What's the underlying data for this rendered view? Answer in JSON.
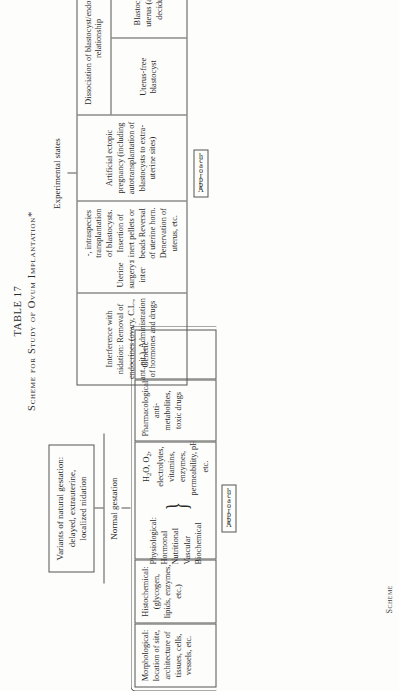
{
  "title": {
    "line1": "TABLE 17",
    "line2": "Scheme for Study of Ovum Implantation*"
  },
  "footer": {
    "scheme_label": "Scheme"
  },
  "normal_gestation": {
    "variants_box": "Variants of natural gestation: delayed, extrauterine, localized nidation",
    "branch_label": "Normal gestation",
    "approach_label_letters": [
      "A",
      "p",
      "p",
      "r",
      "o",
      "a",
      "c",
      "h"
    ],
    "approach_label": "Approach",
    "cells": [
      {
        "name": "morphological",
        "text": "Morphological: location of site, architecture of tissues, cells, vessels, etc."
      },
      {
        "name": "histochemical",
        "text": "Histochemical: (glycogen, lipids, enzymes, etc.)"
      },
      {
        "name": "physiological",
        "heading": "Physiological:",
        "items": [
          "Hormonal",
          "Nutritional",
          "Vascular",
          "Biochemical"
        ],
        "detail": "H2O, O2, electrolytes, vitamins, enzymes, permeability, pH, etc."
      },
      {
        "name": "pharmacological",
        "text": "Pharmacological: anti-metabolites, toxic drugs"
      },
      {
        "name": "genetic",
        "text": "Genetic"
      }
    ]
  },
  "experimental_states": {
    "branch_label": "Experimental states",
    "approach_label_letters": [
      "A",
      "p",
      "p",
      "r",
      "o",
      "a",
      "c",
      "h"
    ],
    "approach_label": "Approach",
    "columns": [
      {
        "name": "interference-with-nidation",
        "text": "Interference with nidation: Removal of endocrines (ovary, C.L., ant. pit.). Administration of hormones and drugs"
      },
      {
        "name": "uterine-surgery",
        "text": "Uterine surgery: inter-, intraspecies transplantation of blastocysts. Insertion of inert pellets or beads Reversal of uterine horn. Denervation of uterus, etc."
      },
      {
        "name": "artificial-ectopic-pregnancy",
        "text": "Artificial ectopic pregnancy (including autotransplantation of blastocysts to extra-uterine sites)"
      }
    ],
    "dissociation": {
      "header": "Dissociation of blastocyst/endometrium relationship",
      "cells": [
        {
          "name": "uterus-free-blastocyst",
          "text": "Uterus-free blastocyst"
        },
        {
          "name": "blastocyst-free-uterus",
          "text": "Blastocyst-free uterus (artificial deciduoma)"
        }
      ]
    }
  }
}
